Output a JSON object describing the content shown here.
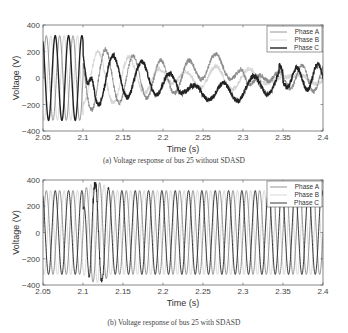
{
  "chart_data": [
    {
      "type": "line",
      "panel": "a",
      "caption": "(a) Voltage response of bus 25 without SDASD",
      "xlabel": "Time (s)",
      "ylabel": "Voltage (V)",
      "xlim": [
        2.05,
        2.4
      ],
      "ylim": [
        -400,
        400
      ],
      "xticks": [
        "2.05",
        "2.1",
        "2.15",
        "2.2",
        "2.25",
        "2.3",
        "2.35",
        "2.4"
      ],
      "yticks": [
        "400",
        "200",
        "0",
        "-200",
        "-400"
      ],
      "grid": false,
      "legend_position": "upper right",
      "series": [
        {
          "name": "Phase A",
          "color": "#8a8a8a",
          "width": 0.9
        },
        {
          "name": "Phase B",
          "color": "#d4d4d4",
          "width": 0.9
        },
        {
          "name": "Phase C",
          "color": "#222222",
          "width": 1.4
        }
      ],
      "description": "Steady 60 Hz sinusoids of ~320 V amplitude until t≈2.1 s, then a fault/disturbance produces noisy, distorted low-frequency oscillations (±250–330 V peaks near 2.12–2.22 s) settling to ~±100 V swings; Phase C dips to about -120 V near 2.27 s and recovers into ~±100 V oscillations after 2.35 s.",
      "normal_amplitude": 320,
      "disturbance_start": 2.1
    },
    {
      "type": "line",
      "panel": "b",
      "caption": "(b) Voltage response of bus 25 with SDASD",
      "xlabel": "Time (s)",
      "ylabel": "Voltage (V)",
      "xlim": [
        2.05,
        2.4
      ],
      "ylim": [
        -400,
        400
      ],
      "xticks": [
        "2.05",
        "2.1",
        "2.15",
        "2.2",
        "2.25",
        "2.3",
        "2.35",
        "2.4"
      ],
      "yticks": [
        "400",
        "200",
        "0",
        "-200",
        "-400"
      ],
      "grid": false,
      "legend_position": "upper right",
      "series": [
        {
          "name": "Phase A",
          "color": "#8a8a8a",
          "width": 0.9
        },
        {
          "name": "Phase B",
          "color": "#d4d4d4",
          "width": 0.9
        },
        {
          "name": "Phase C",
          "color": "#222222",
          "width": 0.9
        }
      ],
      "description": "60 Hz sinusoids of ~320 V amplitude throughout; a brief transient around t≈2.10–2.13 s with peaks up to ~390 V and dips to ~-390 V, after which waveforms quickly return to steady ±320 V.",
      "normal_amplitude": 320,
      "transient_window": [
        2.1,
        2.135
      ],
      "transient_peak": 390
    }
  ]
}
